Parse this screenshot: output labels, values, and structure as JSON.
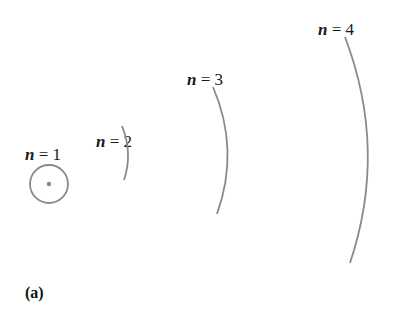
{
  "figure": {
    "caption": "(a)",
    "colors": {
      "orbit": "#8a8a8a",
      "nucleus": "#8a8a8a",
      "text": "#1a1a1a"
    },
    "orbits": [
      {
        "var": "n",
        "eq": " = ",
        "value": "1",
        "label": "n = 1",
        "shape": "full-circle"
      },
      {
        "var": "n",
        "eq": " = ",
        "value": "2",
        "label": "n = 2",
        "shape": "arc"
      },
      {
        "var": "n",
        "eq": " = ",
        "value": "3",
        "label": "n = 3",
        "shape": "arc"
      },
      {
        "var": "n",
        "eq": " = ",
        "value": "4",
        "label": "n = 4",
        "shape": "arc"
      }
    ]
  }
}
